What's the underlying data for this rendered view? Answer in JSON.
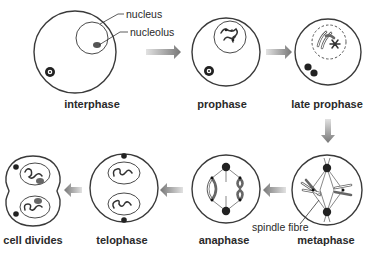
{
  "stages": [
    {
      "id": "interphase",
      "label": "interphase"
    },
    {
      "id": "prophase",
      "label": "prophase"
    },
    {
      "id": "late-prophase",
      "label": "late prophase"
    },
    {
      "id": "metaphase",
      "label": "metaphase"
    },
    {
      "id": "anaphase",
      "label": "anaphase"
    },
    {
      "id": "telophase",
      "label": "telophase"
    },
    {
      "id": "cell-divides",
      "label": "cell divides"
    }
  ],
  "callouts": {
    "nucleus": "nucleus",
    "nucleolus": "nucleolus",
    "spindle_fibre": "spindle fibre"
  },
  "flow": [
    "interphase",
    "prophase",
    "late prophase",
    "metaphase",
    "anaphase",
    "telophase",
    "cell divides"
  ],
  "colors": {
    "outline": "#3a3a3a",
    "arrow_dark": "#7a7a7a",
    "arrow_light": "#d8d8d8",
    "text": "#2a2a2a"
  }
}
